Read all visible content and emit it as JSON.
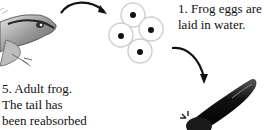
{
  "diagram": {
    "stages": [
      {
        "number": "1.",
        "text_lines": [
          "1. Frog eggs are",
          "laid in water."
        ],
        "image": "frog-eggs"
      },
      {
        "number": "5.",
        "text_lines": [
          "5. Adult frog.",
          "The tail has",
          "been reabsorbed"
        ],
        "image": "adult-frog"
      }
    ],
    "partial_stage_images": [
      "tadpole"
    ],
    "arrows": [
      {
        "from": "adult-frog",
        "to": "frog-eggs"
      },
      {
        "from": "frog-eggs",
        "to": "tadpole"
      }
    ]
  },
  "labels": {
    "stage1": "1. Frog eggs are\nlaid in water.",
    "stage5": "5. Adult frog.\nThe tail has\nbeen reabsorbed"
  },
  "colors": {
    "ink": "#111111",
    "egg_outline": "#cfcfcf",
    "background": "#ffffff"
  }
}
